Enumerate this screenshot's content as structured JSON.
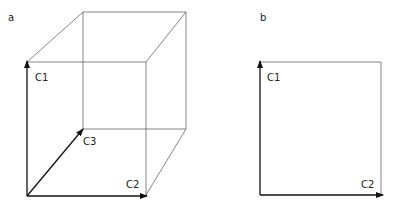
{
  "panels": [
    {
      "id": "a",
      "label": "a",
      "type": "3d-cube",
      "axes": [
        "C1",
        "C2",
        "C3"
      ]
    },
    {
      "id": "b",
      "label": "b",
      "type": "2d-square",
      "axes": [
        "C1",
        "C2"
      ]
    }
  ],
  "colors": {
    "line": "#666666",
    "axis": "#111111",
    "text": "#222222"
  }
}
